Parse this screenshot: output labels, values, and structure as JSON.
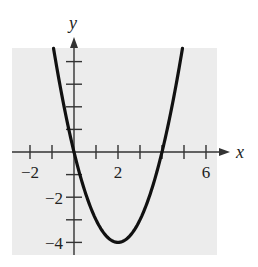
{
  "chart_data": {
    "type": "line",
    "title": "",
    "function": "y = x^2 - 4x",
    "xlabel": "x",
    "ylabel": "y",
    "xlim": [
      -2.8,
      6.5
    ],
    "ylim": [
      -4.5,
      4.6
    ],
    "x_ticks": [
      -2,
      -1,
      0,
      1,
      2,
      3,
      4,
      5,
      6
    ],
    "x_tick_labels": [
      "-2",
      "2",
      "6"
    ],
    "x_tick_label_values": [
      -2,
      2,
      6
    ],
    "y_ticks": [
      -4,
      -3,
      -2,
      -1,
      1,
      2,
      3,
      4
    ],
    "y_tick_labels": [
      "-2",
      "-4"
    ],
    "y_tick_label_values": [
      -2,
      -4
    ],
    "grid": false,
    "background": "#ececec",
    "line_color": "#111111",
    "vertex": [
      2,
      -4
    ],
    "x_intercepts": [
      0,
      4
    ],
    "series": [
      {
        "name": "parabola",
        "x": [
          -0.93,
          -0.5,
          0,
          0.5,
          1,
          1.5,
          2,
          2.5,
          3,
          3.5,
          4,
          4.5,
          4.93
        ],
        "values": [
          4.58,
          2.25,
          0,
          -1.75,
          -3,
          -3.75,
          -4,
          -3.75,
          -3,
          -1.75,
          0,
          2.25,
          4.58
        ]
      }
    ]
  },
  "labels": {
    "x_axis": "x",
    "y_axis": "y",
    "xt_m2": "−2",
    "xt_2": "2",
    "xt_6": "6",
    "yt_m2": "−2",
    "yt_m4": "−4"
  }
}
